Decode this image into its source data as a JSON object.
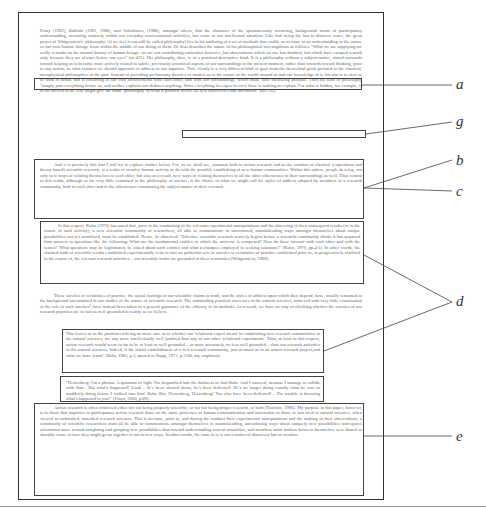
{
  "figure": {
    "paragraphs": [
      {
        "id": "p1",
        "text": "Ponty (1962), Bakhtin (1981, 1986), and Voloshinov, (1986), amongst others, that the character of the spontaneously occurring, background forms of participatory understanding, occurring routinely within our everyday conversational activities, has come to our intellectual attention. Like fish being the last to discover water, the great power of Wittgenstein's 'philosophy' (if we feel it can still be called philosophy) lies in his outlining of a set of methods that enable us to come to an understanding of the nature of our own human 'doings' from within the middle of our doing of them. He thus describes the nature of his philosophical investigations as follows: \"What we are supplying are really remarks on the natural history of human beings; we are not contributing curiosities however, but observations which no one has doubted, but which have escaped remark only because they are always before our eyes\" (no.415). His philosophy, then, is of a practical-descriptive kind. It is a philosophy without a subject-matter, aimed outwards toward helping us to become more actively related to subtle, previously unnoticed aspects of our surroundings in the present moment, rather than towards toward thinking, prior to any action, as what features we should approach or address in our inquiries. This, clearly is a very different kind of goal from the theoretical goals pursued in the classical, metaphysical philosophies of the past. Instead of providing preliminary theories or models as to the nature of the world around us and our knowledge of it, his aim is to alert us to what in actual fact is occurring in our own involvements with each other, and with our surroundings, which make such theorizing possible. Thus his kind of philosophy \"simply puts everything before us, and neither explains nor deduces anything. Since everything lies open to view there is nothing to explain. For what is hidden, for example, is of no interest to us. One might give the name 'philosophy' to what is possible before all new discoveries and inventions\" (no.126)."
      },
      {
        "id": "p2",
        "text": "And it is precisely this that I will try to explore further below. For, as we shall see, common both to action research and to the conduct of classical (experiment and theory based) scientific research, is a realm of creative human activity to do with the possible establishing of new human communities. Within this sphere, people develop, not only new ways of relating themselves to each other, but also as a result, new ways of relating themselves to all the other othernesses in their surroundings as well. Thus central in this realm, although so far very little examined in the philosophy of science, is the choice of what we might call the styles of address adopted by members of a research community, both to each other and to the othernesses constituting the subject matter of their research."
      },
      {
        "id": "p3",
        "text": "In this respect, Kuhn (1970) has noted that, prior to the conducting of the relevant experimental manipulations and the observing of their consequent results (or in the course of such activity), a new scientific community of researchers, all able to communicate in unconfused, nonmisleading ways amongst themselves about unique possibilities not yet actualized, must be established. Hence, he observed: \"Effective scientific research scarcely begins before a scientific community thinks it has acquired firm answers to questions like the following: What are the fundamental entities of which the universe is composed? How do these interact with each other and with the senses? What questions may be legitimately be asked about such entities and what techniques employed in seeking solutions?\" (Kuhn, 1970, pp.4-5). In other words, the claimed truth of scientific results established experimentally rests in fact on particular sets of sureties or certainties of practice established prior to, or progressively clarified in the course of, the relevant research activities – our scientific truths are grounded in these certainties (Wittgenstein, 1969)."
      },
      {
        "id": "p4",
        "text": "These sureties or certainties of practice, the social rootings of our scientific claims to truth, and the styles of address upon which they depend, have, usually remained in the background unexamined in our studies of the nature of scientific research. The outstanding practical successes of the natural sciences, achieved with very little examination of the role of such sureties³, have instead been taken as a general guarantee of the efficacy of its methods. As a result, we have no way of checking whether the sureties of our research practices are in fact as well grounded in reality as we believe."
      },
      {
        "id": "p5",
        "text": "This leaves us in the position of being no more sure as to whether our 'relational experi ments' in establishing new research communities in the natural sciences, are any more intellectually well justified than any of our other 'relational experiments'. Thus, at least in this respect, action research would seem so far to be at least as well grounded – or more accurately, no less well grounded – than our research activities in the natural sciences. Indeed, if the initial establishment of a new research community, just as much as in an action research project,and what we have learnt\" (Bohr, 1963, p.3, quoted in Stapp, 1972, p.1106, my emphasis)."
      },
      {
        "id": "p6",
        "text": "\"Heisenberg: I'm a photon. A quantum of light. I'm despatched into the darkness to find Bohr. And I succeed, because I manage to collide with him... But what's happened? Look – he's been slowed down, he's been deflected! He's no longer doing exactly what he was so maddenly doing before I walked into him! Bohr: But, Heisenberg, Heisenberg! You also have been deflected!... The trouble is knowing what's happened to you!\" (Frayn, 2000, p.69)."
      },
      {
        "id": "p7",
        "text": "Action research is often criticized either for not being properly scientific, or for not being proper research, or both (Toulmin, 1996). My purpose in this paper, however, is to show that inquiries in participatory action research draw on the same processes of human communication and interaction as those in fact used in natural sciences, when viewed as unfinished, unsettled research sciences. This is because, prior to, and during the conduct their experimental manipulations and the making of their observations, a community of scientific researchers must all be able to communicate amongst themselves in nonmisleading, unconfusing ways about uniquely new possibilities notrequires orientation more toward imagining and grasping new possibilities than toward understanding current actualities, and members must fashion between themselves new shared or sharable sense of how they might go on together to act in new ways. In other words, the issue here is not a matter of discovery but of creation."
      }
    ],
    "annotation_labels": {
      "a": "a",
      "g": "g",
      "b": "b",
      "c": "c",
      "d": "d",
      "e": "e"
    },
    "caption": ""
  }
}
